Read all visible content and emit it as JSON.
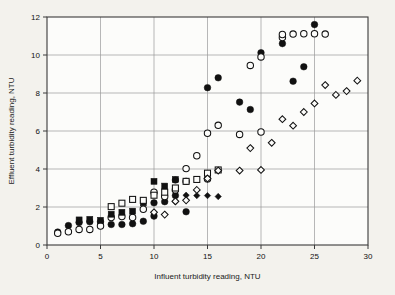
{
  "chart_data": {
    "type": "scatter",
    "title": "",
    "xlabel": "Influent turbidity reading, NTU",
    "ylabel": "Effluent turbidity reading, NTU",
    "xlim": [
      0,
      30
    ],
    "ylim": [
      0,
      12
    ],
    "xticks": [
      0,
      5,
      10,
      15,
      20,
      25,
      30
    ],
    "yticks": [
      0,
      2,
      4,
      6,
      8,
      10,
      12
    ],
    "xtick_labels": [
      "0",
      "5",
      "10",
      "15",
      "20",
      "25",
      "30"
    ],
    "ytick_labels": [
      "0",
      "2",
      "4",
      "6",
      "8",
      "10",
      "12"
    ],
    "grid": true,
    "grid_color": "#9a9a9a",
    "legend": "none",
    "frame_color": "#3a3a3a",
    "background": "#f3f2ed",
    "plot_background": "#fcfcfa",
    "series": [
      {
        "name": "filled-circle",
        "marker": "filled-circle",
        "color": "#111111",
        "points": [
          [
            1,
            0.68
          ],
          [
            2,
            1.02
          ],
          [
            3,
            1.18
          ],
          [
            4,
            1.22
          ],
          [
            5,
            1.22
          ],
          [
            6,
            1.08
          ],
          [
            7,
            1.08
          ],
          [
            8,
            1.12
          ],
          [
            9,
            1.25
          ],
          [
            10,
            2.22
          ],
          [
            10,
            1.52
          ],
          [
            11,
            2.28
          ],
          [
            12,
            3.42
          ],
          [
            12,
            2.6
          ],
          [
            13,
            1.75
          ],
          [
            15,
            8.28
          ],
          [
            16,
            8.8
          ],
          [
            18,
            7.52
          ],
          [
            19,
            7.13
          ],
          [
            20,
            10.12
          ],
          [
            22,
            10.6
          ],
          [
            23,
            8.62
          ],
          [
            24,
            9.38
          ],
          [
            25,
            11.6
          ]
        ]
      },
      {
        "name": "open-circle",
        "marker": "open-circle",
        "color": "#111111",
        "points": [
          [
            1,
            0.62
          ],
          [
            2,
            0.7
          ],
          [
            3,
            0.82
          ],
          [
            4,
            0.82
          ],
          [
            5,
            1.0
          ],
          [
            6,
            1.45
          ],
          [
            7,
            1.5
          ],
          [
            8,
            1.45
          ],
          [
            9,
            1.88
          ],
          [
            10,
            2.78
          ],
          [
            11,
            2.55
          ],
          [
            12,
            2.9
          ],
          [
            13,
            4.02
          ],
          [
            14,
            4.7
          ],
          [
            15,
            5.88
          ],
          [
            16,
            6.3
          ],
          [
            18,
            5.82
          ],
          [
            19,
            9.45
          ],
          [
            20,
            9.9
          ],
          [
            20,
            5.95
          ],
          [
            22,
            10.92
          ],
          [
            22,
            11.08
          ],
          [
            23,
            11.1
          ],
          [
            24,
            11.12
          ],
          [
            25,
            11.12
          ],
          [
            26,
            11.1
          ],
          [
            15,
            3.48
          ],
          [
            13,
            3.35
          ]
        ]
      },
      {
        "name": "filled-square",
        "marker": "filled-square",
        "color": "#111111",
        "points": [
          [
            3,
            1.32
          ],
          [
            4,
            1.35
          ],
          [
            5,
            1.3
          ],
          [
            6,
            1.62
          ],
          [
            7,
            1.72
          ],
          [
            8,
            1.78
          ],
          [
            9,
            2.22
          ],
          [
            10,
            3.35
          ],
          [
            11,
            3.1
          ],
          [
            12,
            3.45
          ]
        ]
      },
      {
        "name": "open-square",
        "marker": "open-square",
        "color": "#111111",
        "points": [
          [
            6,
            2.02
          ],
          [
            7,
            2.2
          ],
          [
            8,
            2.4
          ],
          [
            9,
            2.35
          ],
          [
            10,
            2.62
          ],
          [
            11,
            2.78
          ],
          [
            12,
            3.0
          ],
          [
            13,
            3.35
          ],
          [
            14,
            3.45
          ],
          [
            15,
            3.78
          ],
          [
            16,
            3.95
          ]
        ]
      },
      {
        "name": "filled-diamond",
        "marker": "filled-diamond",
        "color": "#111111",
        "points": [
          [
            12,
            2.28
          ],
          [
            13,
            2.62
          ],
          [
            14,
            2.6
          ],
          [
            15,
            2.6
          ],
          [
            16,
            2.55
          ]
        ]
      },
      {
        "name": "open-diamond",
        "marker": "open-diamond",
        "color": "#111111",
        "points": [
          [
            10,
            1.72
          ],
          [
            11,
            1.6
          ],
          [
            12,
            2.3
          ],
          [
            13,
            2.35
          ],
          [
            14,
            2.9
          ],
          [
            15,
            3.5
          ],
          [
            16,
            3.92
          ],
          [
            18,
            3.92
          ],
          [
            19,
            5.1
          ],
          [
            20,
            3.95
          ],
          [
            21,
            5.38
          ],
          [
            22,
            6.62
          ],
          [
            23,
            6.28
          ],
          [
            24,
            7.0
          ],
          [
            25,
            7.45
          ],
          [
            26,
            8.42
          ],
          [
            27,
            7.9
          ],
          [
            28,
            8.1
          ],
          [
            29,
            8.65
          ]
        ]
      }
    ]
  },
  "axes": {
    "x_title": "Influent turbidity reading, NTU",
    "y_title": "Effluent turbidity reading, NTU"
  }
}
